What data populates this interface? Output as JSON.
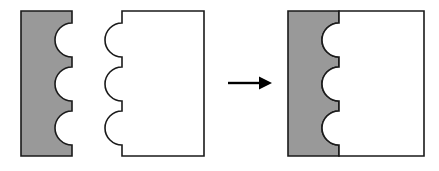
{
  "figure": {
    "title": "Interlocking puzzle pieces assembly diagram",
    "background_color": "#ffffff",
    "width": 439,
    "height": 171,
    "outline_color": "#1a1a1a",
    "outline_width": 1.6,
    "gray_fill": "#999999",
    "white_fill": "#ffffff",
    "arrow_color": "#000000",
    "notch_count": 3,
    "notch_radius": 17,
    "notch_centers_y": [
      40,
      84,
      128
    ]
  },
  "left_piece": {
    "label": "gray-piece-with-notches",
    "fill": "#999999",
    "x": 21,
    "y": 11,
    "width": 51,
    "height": 145,
    "edge_with_features": "right",
    "feature_type": "concave-semicircular-notches",
    "path": "M 21 11 L 72 11 L 72 23 A 17 17 0 0 0 72 57 L 72 67 A 17 17 0 0 0 72 101 L 72 111 A 17 17 0 0 0 72 145 L 72 156 L 21 156 Z"
  },
  "middle_piece": {
    "label": "white-piece-with-tabs",
    "fill": "#ffffff",
    "x": 122,
    "y": 11,
    "width": 82,
    "height": 145,
    "edge_with_features": "left",
    "feature_type": "convex-semicircular-tabs",
    "path": "M 122 11 L 204 11 L 204 156 L 122 156 L 122 145 A 17 17 0 1 1 122 111 L 122 101 A 17 17 0 1 1 122 67 L 122 57 A 17 17 0 1 1 122 23 Z"
  },
  "arrow": {
    "label": "transformation-arrow",
    "direction": "right",
    "color": "#000000",
    "x_start": 228,
    "x_end": 272,
    "y": 83,
    "shaft_x_end": 259,
    "head_width": 13,
    "head_half_height": 6.5
  },
  "result_gray_piece": {
    "label": "assembled-gray-piece",
    "fill": "#999999",
    "x": 288,
    "y": 11,
    "width": 51,
    "height": 145,
    "path": "M 288 11 L 339 11 L 339 23 A 17 17 0 0 0 339 57 L 339 67 A 17 17 0 0 0 339 101 L 339 111 A 17 17 0 0 0 339 145 L 339 156 L 288 156 Z"
  },
  "result_white_piece": {
    "label": "assembled-white-piece",
    "fill": "#ffffff",
    "x": 339,
    "y": 11,
    "width": 85,
    "height": 145,
    "path": "M 339 11 L 424 11 L 424 156 L 339 156 L 339 145 A 17 17 0 1 1 339 111 L 339 101 A 17 17 0 1 1 339 67 L 339 57 A 17 17 0 1 1 339 23 Z"
  }
}
